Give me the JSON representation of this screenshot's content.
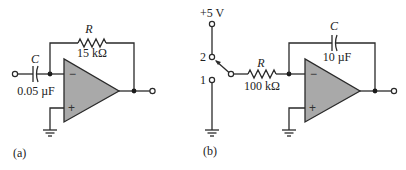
{
  "figure": {
    "panels": [
      {
        "id": "a",
        "caption": "(a)",
        "capacitor": {
          "symbol": "C",
          "value": "0.05 µF"
        },
        "resistor": {
          "symbol": "R",
          "value": "15 kΩ"
        },
        "opamp": {
          "minus": "−",
          "plus": "+"
        }
      },
      {
        "id": "b",
        "caption": "(b)",
        "supply": "+5 V",
        "switch": {
          "pos2": "2",
          "pos1": "1"
        },
        "resistor": {
          "symbol": "R",
          "value": "100 kΩ"
        },
        "capacitor": {
          "symbol": "C",
          "value": "10 µF"
        },
        "opamp": {
          "minus": "−",
          "plus": "+"
        }
      }
    ],
    "colors": {
      "opamp_fill": "#a9a9a9",
      "line": "#2a2a2a"
    }
  }
}
